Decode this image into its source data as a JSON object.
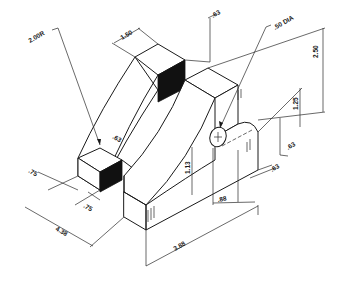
{
  "figure": {
    "type": "isometric engineering drawing",
    "colors": {
      "line": "#1a1a1a",
      "background": "#ffffff",
      "shaded_face": "#111111"
    }
  },
  "dimensions": {
    "arc_radius": "2.00R",
    "top_width": "1.50",
    "top_depth": ".63",
    "hole": ".50 DIA",
    "overall_height": "2.50",
    "boss_height": "1.25",
    "hole_height": "1.13",
    "slot_width": ".63",
    "right_offset_1": ".63",
    "right_offset_2": ".63",
    "hole_offset": ".88",
    "front_depth_1": ".75",
    "front_depth_2": ".75",
    "overall_depth": "4.38",
    "overall_width": "3.88"
  }
}
